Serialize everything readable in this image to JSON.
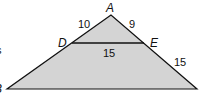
{
  "diagram": {
    "type": "geometry-triangle",
    "fill_color": "#d4d4d4",
    "stroke_color": "#111111",
    "vertices": {
      "A": {
        "label": "A"
      },
      "B": {
        "label": "B"
      },
      "D": {
        "label": "D"
      },
      "E": {
        "label": "E"
      }
    },
    "segments": {
      "AD": "10",
      "AE": "9",
      "DE": "15",
      "EC": "15"
    },
    "cut_text": {
      "left_mid": "s",
      "left_bottom": "B"
    }
  }
}
